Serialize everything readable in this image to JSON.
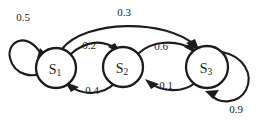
{
  "diagram": {
    "type": "markov-chain-state-transition-diagram",
    "background_color": "#ffffff",
    "stroke_color": "#1c1c1c",
    "nodes": [
      {
        "id": "S1",
        "name": "S",
        "subscript": "1",
        "cx": 56,
        "cy": 68,
        "r": 20
      },
      {
        "id": "S2",
        "name": "S",
        "subscript": "2",
        "cx": 123,
        "cy": 67,
        "r": 20
      },
      {
        "id": "S3",
        "name": "S",
        "subscript": "3",
        "cx": 207,
        "cy": 67,
        "r": 21
      }
    ],
    "edges": [
      {
        "id": "e-s1-s1",
        "from": "S1",
        "to": "S1",
        "label": "0.5",
        "kind": "self-loop",
        "label_x": 23,
        "label_y": 17
      },
      {
        "id": "e-s1-s2",
        "from": "S1",
        "to": "S2",
        "label": "0.2",
        "kind": "arc",
        "label_x": 89,
        "label_y": 45
      },
      {
        "id": "e-s2-s1",
        "from": "S2",
        "to": "S1",
        "label": "0.4",
        "kind": "arc",
        "label_x": 92,
        "label_y": 90
      },
      {
        "id": "e-s2-s3",
        "from": "S2",
        "to": "S3",
        "label": "0.6",
        "kind": "arc",
        "label_x": 161,
        "label_y": 46
      },
      {
        "id": "e-s3-s2",
        "from": "S3",
        "to": "S2",
        "label": "0.1",
        "kind": "arc",
        "label_x": 166,
        "label_y": 85
      },
      {
        "id": "e-s1-s3",
        "from": "S1",
        "to": "S3",
        "label": "0.3",
        "kind": "long-arc",
        "label_x": 124,
        "label_y": 12
      },
      {
        "id": "e-s3-s3",
        "from": "S3",
        "to": "S3",
        "label": "0.9",
        "kind": "self-loop",
        "label_x": 236,
        "label_y": 109
      }
    ]
  }
}
